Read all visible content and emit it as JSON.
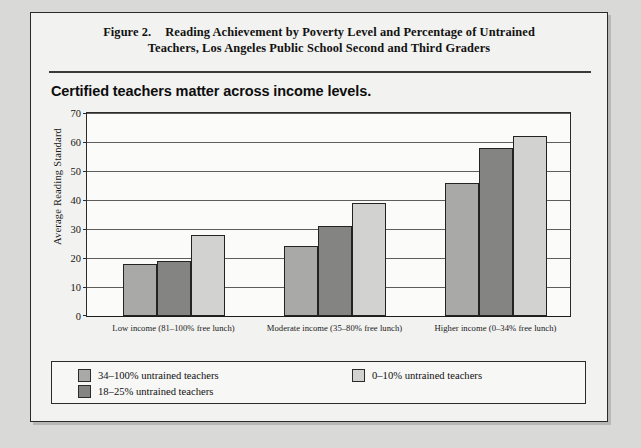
{
  "figure": {
    "number_label": "Figure 2.",
    "title_line1": "Reading Achievement by Poverty Level and Percentage of Untrained",
    "title_line2": "Teachers, Los Angeles Public School Second and Third Graders",
    "subtitle": "Certified teachers matter across income levels."
  },
  "colors": {
    "series_0": "#a9a9a7",
    "series_1": "#848482",
    "series_2": "#d2d2d0",
    "axis": "#2b2b2b",
    "grid": "#5d5d5d",
    "page_background": "#d9d9d7",
    "figure_background": "#f2f2f0"
  },
  "chart_data": {
    "type": "bar",
    "title": "Certified teachers matter across income levels.",
    "xlabel": "",
    "ylabel": "Average Reading Standard",
    "ylim": [
      0,
      70
    ],
    "yticks": [
      0,
      10,
      20,
      30,
      40,
      50,
      60,
      70
    ],
    "grid": true,
    "legend_position": "below-plot",
    "categories": [
      "Low income (81–100% free lunch)",
      "Moderate income (35–80% free lunch)",
      "Higher income (0–34% free lunch)"
    ],
    "series": [
      {
        "name": "34–100% untrained teachers",
        "color": "#a9a9a7",
        "values": [
          18,
          24,
          46
        ]
      },
      {
        "name": "18–25% untrained teachers",
        "color": "#848482",
        "values": [
          19,
          31,
          58
        ]
      },
      {
        "name": "0–10% untrained teachers",
        "color": "#d2d2d0",
        "values": [
          28,
          39,
          62
        ]
      }
    ]
  },
  "legend": {
    "left_column": [
      {
        "label": "34–100% untrained teachers",
        "swatch": "s0"
      },
      {
        "label": "18–25% untrained teachers",
        "swatch": "s1"
      }
    ],
    "right_column": [
      {
        "label": "0–10% untrained teachers",
        "swatch": "s2"
      }
    ]
  }
}
